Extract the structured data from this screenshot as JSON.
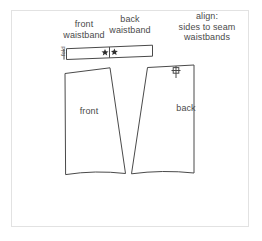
{
  "document": {
    "type": "sewing-pattern-layout-diagram",
    "background_color": "#ffffff",
    "border_color": "#e2e2e2",
    "line_color": "#444444",
    "text_color": "#4a4a4a"
  },
  "annotations": {
    "front_waistband": "front\nwaistband",
    "back_waistband": "back\nwaistband",
    "align_note": "align:\nsides to seam\nwaistbands",
    "fold": "fold"
  },
  "pieces": [
    {
      "id": "front",
      "label": "front"
    },
    {
      "id": "back",
      "label": "back"
    }
  ],
  "markers": {
    "waistband_star_left": "★",
    "waistband_star_right": "★",
    "back_notch": "cross-notch"
  }
}
